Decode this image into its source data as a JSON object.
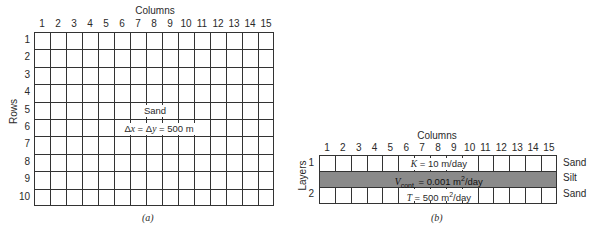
{
  "panel_a": {
    "columns_title": "Columns",
    "rows_title": "Rows",
    "columns": [
      "1",
      "2",
      "3",
      "4",
      "5",
      "6",
      "7",
      "8",
      "9",
      "10",
      "11",
      "12",
      "13",
      "14",
      "15"
    ],
    "rows": [
      "1",
      "2",
      "3",
      "4",
      "5",
      "6",
      "7",
      "8",
      "9",
      "10"
    ],
    "material_label": "Sand",
    "spacing_label_prefix": "Δ",
    "spacing_label": "Δx = Δy = 500 m",
    "spacing": {
      "dx_symbol": "x",
      "dy_symbol": "y",
      "eq": "=",
      "value": "500 m"
    },
    "caption": "(a)"
  },
  "panel_b": {
    "columns_title": "Columns",
    "layers_title": "Layers",
    "columns": [
      "1",
      "2",
      "3",
      "4",
      "5",
      "6",
      "7",
      "8",
      "9",
      "10",
      "11",
      "12",
      "13",
      "14",
      "15"
    ],
    "layers": [
      "1",
      "2"
    ],
    "layer1_param": {
      "symbol": "K",
      "text": " = 10 m/day"
    },
    "silt_param": {
      "symbol": "V",
      "sub": "cont.",
      "text": " = 0.001 m",
      "sup": "2",
      "unit": "/day"
    },
    "layer2_param": {
      "symbol": "T",
      "text": " = 500 m",
      "sup": "2",
      "unit": "/day"
    },
    "side_labels": [
      "Sand",
      "Silt",
      "Sand"
    ],
    "caption": "(b)",
    "silt_color": "#8a8a8a"
  }
}
